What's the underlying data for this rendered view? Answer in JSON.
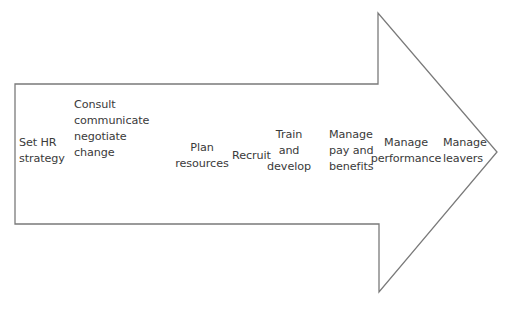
{
  "diagram": {
    "type": "process-arrow",
    "stroke_color": "#777777",
    "text_color": "#3a3a3a",
    "steps": [
      {
        "label": "Set HR\nstrategy"
      },
      {
        "label": "Consult\ncommunicate\nnegotiate\nchange"
      },
      {
        "label": "Plan\nresources"
      },
      {
        "label": "Recruit"
      },
      {
        "label": "Train\nand\ndevelop"
      },
      {
        "label": "Manage\npay and\nbenefits"
      },
      {
        "label": "Manage\nperformance"
      },
      {
        "label": "Manage\nleavers"
      }
    ]
  }
}
